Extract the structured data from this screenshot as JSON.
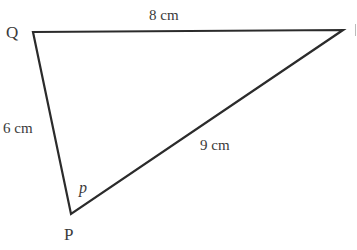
{
  "diagram": {
    "type": "triangle",
    "stroke_color": "#2b2b2b",
    "text_color": "#3a3a3a",
    "vertices": [
      {
        "name": "Q",
        "x": 33,
        "y": 32
      },
      {
        "name": "R",
        "x": 343,
        "y": 30
      },
      {
        "name": "P",
        "x": 71,
        "y": 214
      }
    ],
    "vertex_labels": {
      "q": "Q",
      "p": "P"
    },
    "sides": {
      "qr": {
        "label": "8 cm",
        "from": "Q",
        "to": "R"
      },
      "qp": {
        "label": "6 cm",
        "from": "Q",
        "to": "P"
      },
      "pr": {
        "label": "9 cm",
        "from": "P",
        "to": "R"
      }
    },
    "angle_label": {
      "at": "P",
      "text": "p"
    }
  }
}
